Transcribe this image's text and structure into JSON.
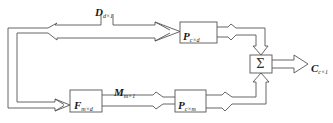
{
  "diagram": {
    "type": "block-diagram",
    "stroke_color": "#555555",
    "background": "#ffffff",
    "input": {
      "symbol": "D",
      "subscript": "d×1"
    },
    "intermediate": {
      "symbol": "M",
      "subscript": "m×1"
    },
    "output": {
      "symbol": "C",
      "subscript": "c×1"
    },
    "blocks": [
      {
        "id": "P_cd",
        "symbol": "P",
        "subscript": "c×d"
      },
      {
        "id": "F_md",
        "symbol": "F",
        "subscript": "m×d"
      },
      {
        "id": "P_cm",
        "symbol": "P",
        "subscript": "c×m"
      },
      {
        "id": "sum",
        "symbol": "Σ"
      }
    ],
    "edges": [
      {
        "from": "D",
        "to": "P_cd"
      },
      {
        "from": "D",
        "to": "F_md"
      },
      {
        "from": "F_md",
        "to": "P_cm",
        "label": "M"
      },
      {
        "from": "P_cd",
        "to": "sum"
      },
      {
        "from": "P_cm",
        "to": "sum"
      },
      {
        "from": "sum",
        "to": "C"
      }
    ]
  }
}
